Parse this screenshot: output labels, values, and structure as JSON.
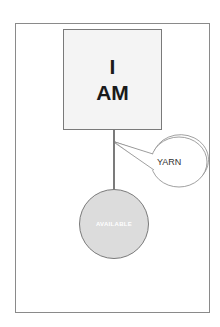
{
  "diagram": {
    "box": {
      "line1": "I",
      "line2": "AM"
    },
    "bubble": {
      "label": "YARN"
    },
    "circle": {
      "label": "AVAILABLE"
    }
  }
}
